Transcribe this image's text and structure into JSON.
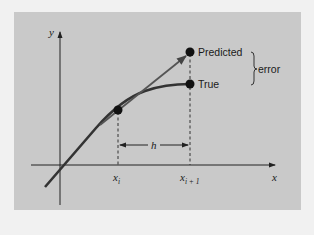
{
  "diagram": {
    "axes": {
      "x_label": "x",
      "y_label": "y"
    },
    "points": {
      "predicted_label": "Predicted",
      "true_label": "True",
      "error_label": "error"
    },
    "ticks": {
      "xi": "x",
      "xi_sub": "i",
      "xi1": "x",
      "xi1_sub": "i + 1"
    },
    "step_label": "h",
    "colors": {
      "background": "#c9c9c9",
      "line": "#2a2a2a",
      "curve": "#333333"
    }
  }
}
